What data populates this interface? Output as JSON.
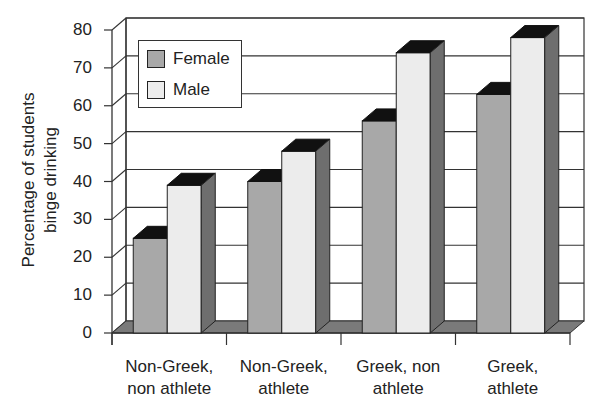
{
  "chart_data": {
    "type": "bar",
    "style": "3d-clustered-column",
    "title": "",
    "xlabel": "",
    "ylabel": "Percentage of students binge drinking",
    "ylabel_lines": [
      "Percentage of students",
      "binge drinking"
    ],
    "ylim": [
      0,
      80
    ],
    "yticks": [
      0,
      10,
      20,
      30,
      40,
      50,
      60,
      70,
      80
    ],
    "grid": true,
    "legend_position": "upper-left-inside",
    "categories": [
      "Non-Greek, non athlete",
      "Non-Greek, athlete",
      "Greek, non athlete",
      "Greek, athlete"
    ],
    "category_lines": [
      [
        "Non-Greek,",
        "non athlete"
      ],
      [
        "Non-Greek,",
        "athlete"
      ],
      [
        "Greek, non",
        "athlete"
      ],
      [
        "Greek,",
        "athlete"
      ]
    ],
    "series": [
      {
        "name": "Female",
        "color": "#a8a8a8",
        "values": [
          25,
          40,
          56,
          63
        ]
      },
      {
        "name": "Male",
        "color": "#ececec",
        "values": [
          39,
          48,
          74,
          78
        ]
      }
    ]
  },
  "legend": {
    "items": [
      {
        "label": "Female",
        "color": "#a8a8a8"
      },
      {
        "label": "Male",
        "color": "#ececec"
      }
    ]
  },
  "axis": {
    "y_ticks": [
      "0",
      "10",
      "20",
      "30",
      "40",
      "50",
      "60",
      "70",
      "80"
    ]
  }
}
